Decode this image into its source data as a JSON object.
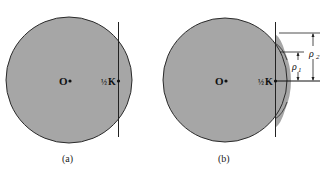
{
  "figure": {
    "colors": {
      "fill": "#a6a6a6",
      "stroke": "#2a2a2a",
      "background": "#ffffff"
    },
    "panels": [
      {
        "id": "a",
        "caption": "(a)",
        "center_label": "O",
        "point_label_fraction": "½",
        "point_label": "K"
      },
      {
        "id": "b",
        "caption": "(b)",
        "center_label": "O",
        "point_label_fraction": "½",
        "point_label": "K",
        "dimension_labels": {
          "rho1": "ρ",
          "rho1_sub": "1",
          "rho2": "ρ",
          "rho2_sub": "2"
        }
      }
    ]
  }
}
